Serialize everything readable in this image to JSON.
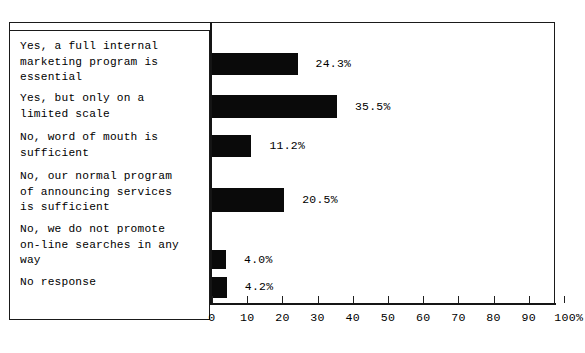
{
  "chart_data": {
    "type": "bar",
    "orientation": "horizontal",
    "title": "",
    "subtitle": "",
    "xlabel": "",
    "ylabel": "",
    "xlim": [
      0,
      100
    ],
    "grid": false,
    "legend": null,
    "axis_unit": "%",
    "categories": [
      "Yes, a full internal\nmarketing program is\nessential",
      "Yes, but only on a\nlimited scale",
      "No, word of mouth is\nsufficient",
      "No, our normal program\nof announcing services\nis sufficient",
      "No, we do not promote\non-line searches in any\nway",
      "No response"
    ],
    "values": [
      24.3,
      35.5,
      11.2,
      20.5,
      4.0,
      4.2
    ],
    "value_labels": [
      "24.3%",
      "35.5%",
      "11.2%",
      "20.5%",
      "4.0%",
      "4.2%"
    ],
    "x_ticks": [
      0,
      10,
      20,
      30,
      40,
      50,
      60,
      70,
      80,
      90,
      100
    ],
    "x_tick_labels": [
      "0",
      "10",
      "20",
      "30",
      "40",
      "50",
      "60",
      "70",
      "80",
      "90",
      "100%"
    ],
    "colors": {
      "bar": "#0a0a0a",
      "axis": "#151515",
      "background": "#ffffff",
      "text": "#000000"
    }
  }
}
